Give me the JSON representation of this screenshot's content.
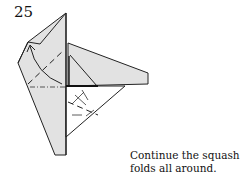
{
  "step": {
    "number": "25"
  },
  "caption": {
    "line1": "Continue the squash",
    "line2": "folds all around."
  },
  "colors": {
    "paper_shaded": "#e0e0e0",
    "paper_white": "#ffffff",
    "line": "#222222"
  },
  "diagram": {
    "fold_lines": [
      "valley",
      "mountain"
    ],
    "arrows": [
      "curved-squash-arrow"
    ]
  }
}
